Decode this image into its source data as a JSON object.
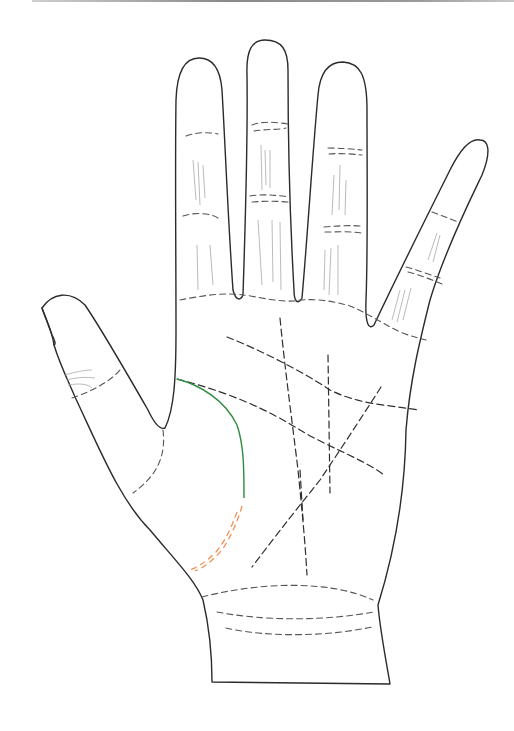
{
  "figure": {
    "colors": {
      "outline": "#2b2b2b",
      "palm_lines": "#2f2f2f",
      "life_line_highlight": "#2e8b3e",
      "life_line_broken_segment": "#f08a4b",
      "background": "#ffffff"
    },
    "elements": [
      "hand-outline",
      "finger-creases",
      "heart-line",
      "head-line",
      "life-line",
      "fate-line",
      "sun-line",
      "mercury-line",
      "wrist-bracelets"
    ]
  }
}
